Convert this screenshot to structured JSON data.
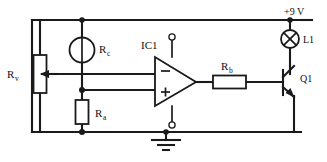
{
  "diagram": {
    "type": "schematic",
    "width": 327,
    "height": 162,
    "background": "#ffffff",
    "ink_color": "#1a1a1a"
  },
  "labels": {
    "supply": "+9 V",
    "lamp": "L1",
    "ic": "IC1",
    "rv_main": "R",
    "rv_sub": "v",
    "rc_main": "R",
    "rc_sub": "c",
    "ra_main": "R",
    "ra_sub": "a",
    "rb_main": "R",
    "rb_sub": "b",
    "transistor": "Q1",
    "opamp_inverting": "−",
    "opamp_noninverting": "+"
  },
  "components": [
    {
      "id": "rv",
      "name": "variable-resistor",
      "label": "Rv",
      "symbol": "potentiometer",
      "orientation": "vertical"
    },
    {
      "id": "rc",
      "name": "light-dependent-resistor",
      "label": "Rc",
      "symbol": "ldr-circle",
      "orientation": "vertical"
    },
    {
      "id": "ra",
      "name": "fixed-resistor",
      "label": "Ra",
      "symbol": "resistor-box",
      "orientation": "vertical"
    },
    {
      "id": "rb",
      "name": "base-resistor",
      "label": "Rb",
      "symbol": "resistor-box",
      "orientation": "horizontal"
    },
    {
      "id": "ic1",
      "name": "operational-amplifier",
      "label": "IC1",
      "symbol": "opamp-triangle"
    },
    {
      "id": "l1",
      "name": "lamp",
      "label": "L1",
      "symbol": "lamp-cross-circle"
    },
    {
      "id": "q1",
      "name": "npn-transistor",
      "label": "Q1",
      "symbol": "bjt-npn"
    },
    {
      "id": "gnd",
      "name": "ground",
      "label": "",
      "symbol": "earth-bars"
    }
  ]
}
